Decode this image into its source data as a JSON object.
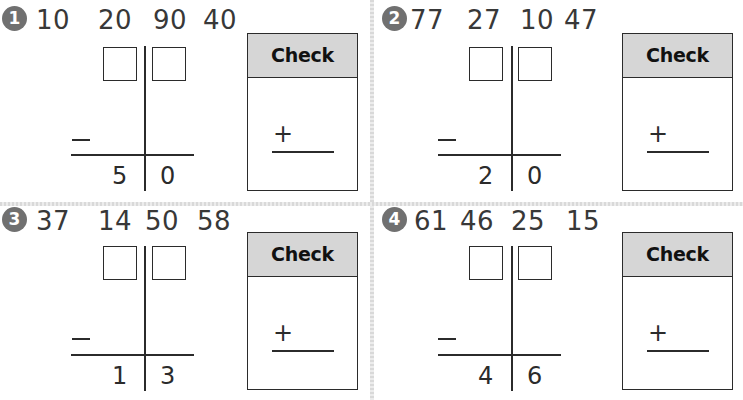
{
  "worksheet": {
    "check_label": "Check",
    "operation_symbol": "−",
    "check_symbol": "+",
    "accent_badge_color": "#707070",
    "check_header_color": "#d6d6d6",
    "problems": [
      {
        "number": "1",
        "choices": [
          "10",
          "20",
          "90",
          "40"
        ],
        "difference_tens": "5",
        "difference_ones": "0"
      },
      {
        "number": "2",
        "choices": [
          "77",
          "27",
          "10",
          "47"
        ],
        "difference_tens": "2",
        "difference_ones": "0"
      },
      {
        "number": "3",
        "choices": [
          "37",
          "14",
          "50",
          "58"
        ],
        "difference_tens": "1",
        "difference_ones": "3"
      },
      {
        "number": "4",
        "choices": [
          "61",
          "46",
          "25",
          "15"
        ],
        "difference_tens": "4",
        "difference_ones": "6"
      }
    ]
  }
}
